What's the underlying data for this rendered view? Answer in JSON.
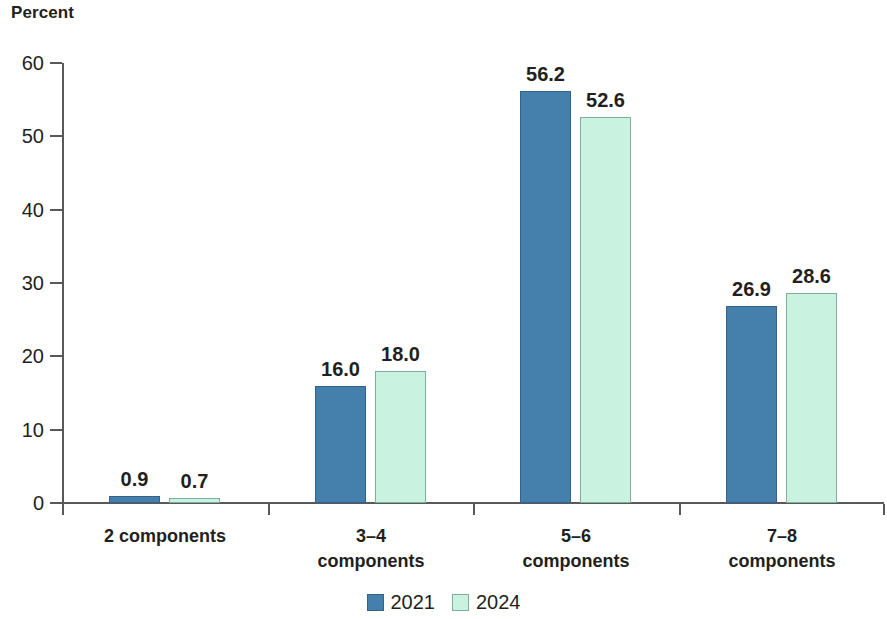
{
  "chart_data": {
    "type": "bar",
    "title": "",
    "xlabel": "",
    "ylabel": "Percent",
    "ylim": [
      0,
      60
    ],
    "yticks": [
      0,
      10,
      20,
      30,
      40,
      50,
      60
    ],
    "ytick_labels": [
      "0",
      "10",
      "20",
      "30",
      "40",
      "50",
      "60"
    ],
    "grid": false,
    "legend_position": "bottom-center",
    "categories": [
      "2 components",
      "3–4\ncomponents",
      "5–6\ncomponents",
      "7–8\ncomponents"
    ],
    "series": [
      {
        "name": "2021",
        "color": "#4580ad",
        "values": [
          0.9,
          16.0,
          56.2,
          26.9
        ],
        "value_labels": [
          "0.9",
          "16.0",
          "56.2",
          "26.9"
        ]
      },
      {
        "name": "2024",
        "color": "#c9f3e0",
        "values": [
          0.7,
          18.0,
          52.6,
          28.6
        ],
        "value_labels": [
          "0.7",
          "18.0",
          "52.6",
          "28.6"
        ]
      }
    ]
  },
  "axis": {
    "y_title": "Percent",
    "y_tick_labels": [
      "60",
      "50",
      "40",
      "30",
      "20",
      "10",
      "0"
    ]
  },
  "legend": {
    "items": [
      {
        "label": "2021",
        "swatch": "legend-swatch-2021"
      },
      {
        "label": "2024",
        "swatch": "legend-swatch-2024"
      }
    ]
  },
  "categories": [
    {
      "line1": "2 components",
      "line2": ""
    },
    {
      "line1": "3–4",
      "line2": "components"
    },
    {
      "line1": "5–6",
      "line2": "components"
    },
    {
      "line1": "7–8",
      "line2": "components"
    }
  ],
  "colors": {
    "series_2021": "#4580ad",
    "series_2021_edge": "#35618a",
    "series_2024": "#c9f3e0",
    "series_2024_edge": "#7fae9b",
    "axis": "#58595b",
    "text": "#231f20",
    "background": "#ffffff"
  }
}
